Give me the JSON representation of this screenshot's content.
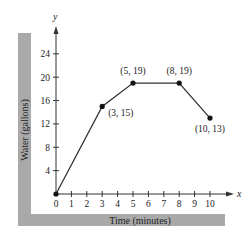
{
  "chart_data": {
    "type": "line",
    "title": "",
    "xlabel": "Time (minutes)",
    "ylabel": "Water (gallons)",
    "x_axis_symbol": "x",
    "y_axis_symbol": "y",
    "xlim": [
      0,
      10
    ],
    "ylim": [
      0,
      24
    ],
    "x_ticks": [
      0,
      1,
      2,
      3,
      4,
      5,
      6,
      7,
      8,
      9,
      10
    ],
    "y_ticks": [
      4,
      8,
      12,
      16,
      20,
      24
    ],
    "grid": false,
    "series": [
      {
        "name": "Water",
        "x": [
          0,
          3,
          5,
          8,
          10
        ],
        "y": [
          0,
          15,
          19,
          19,
          13
        ]
      }
    ],
    "annotations": [
      {
        "label": "(3, 15)",
        "x": 3,
        "y": 15
      },
      {
        "label": "(5, 19)",
        "x": 5,
        "y": 19
      },
      {
        "label": "(8, 19)",
        "x": 8,
        "y": 19
      },
      {
        "label": "(10, 13)",
        "x": 10,
        "y": 13
      }
    ]
  },
  "colors": {
    "band": "#a9a9a9",
    "line": "#333333",
    "axis": "#333333"
  }
}
